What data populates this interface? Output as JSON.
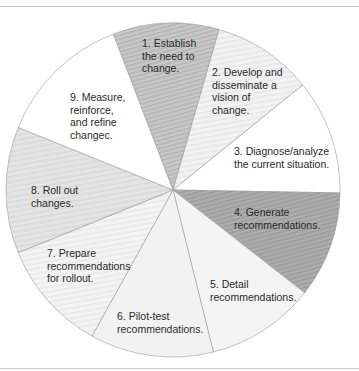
{
  "diagram": {
    "type": "pie-cycle",
    "center": [
      173,
      190
    ],
    "radius": 167,
    "segments": [
      {
        "id": 1,
        "label": "1. Establish\nthe need to\nchange.",
        "start_deg": -111,
        "end_deg": -74,
        "fill": "#c9c9c9",
        "pattern": "stripe-dark",
        "label_pos": [
          142,
          37
        ]
      },
      {
        "id": 2,
        "label": "2. Develop and\ndisseminate a\nvision of\nchange.",
        "start_deg": -74,
        "end_deg": -39,
        "fill": "#f2f2f2",
        "pattern": "stripe-light",
        "label_pos": [
          212,
          66
        ]
      },
      {
        "id": 3,
        "label": "3. Diagnose/analyze\nthe current situation.",
        "start_deg": -39,
        "end_deg": 1,
        "fill": "#ffffff",
        "pattern": "none",
        "label_pos": [
          234,
          145
        ]
      },
      {
        "id": 4,
        "label": "4. Generate\nrecommendations.",
        "start_deg": 1,
        "end_deg": 38,
        "fill": "#aeaeae",
        "pattern": "stripe-dark",
        "label_pos": [
          234,
          206
        ]
      },
      {
        "id": 5,
        "label": "5. Detail\nrecommendations.",
        "start_deg": 38,
        "end_deg": 76,
        "fill": "#f4f4f4",
        "pattern": "none",
        "label_pos": [
          210,
          278
        ]
      },
      {
        "id": 6,
        "label": "6. Pilot-test\nrecommendations.",
        "start_deg": 76,
        "end_deg": 119,
        "fill": "#f2f2f2",
        "pattern": "none",
        "label_pos": [
          117,
          310
        ]
      },
      {
        "id": 7,
        "label": "7. Prepare\nrecommendations\nfor rollout.",
        "start_deg": 119,
        "end_deg": 158,
        "fill": "#f4f4f4",
        "pattern": "stripe-light",
        "label_pos": [
          47,
          247
        ]
      },
      {
        "id": 8,
        "label": "8. Roll out\nchanges.",
        "start_deg": 158,
        "end_deg": 202,
        "fill": "#e4e4e4",
        "pattern": "stripe-light",
        "label_pos": [
          31,
          184
        ]
      },
      {
        "id": 9,
        "label": "9. Measure,\nreinforce,\nand refine\nchangec.",
        "start_deg": 202,
        "end_deg": 249,
        "fill": "#ffffff",
        "pattern": "none",
        "label_pos": [
          70,
          91
        ]
      }
    ],
    "colors": {
      "border": "#9a9a9a",
      "rule": "#c8c8c8",
      "text": "#2a2a2a"
    }
  }
}
